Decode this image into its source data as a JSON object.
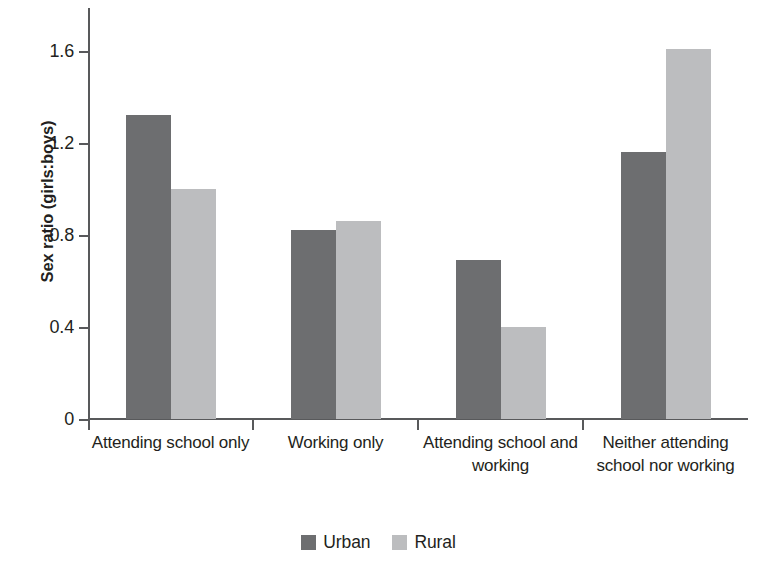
{
  "chart_data": {
    "type": "bar",
    "title": "",
    "xlabel": "",
    "ylabel": "Sex ratio (girls:boys)",
    "categories": [
      "Attending school only",
      "Working only",
      "Attending school and working",
      "Neither attending school nor working"
    ],
    "series": [
      {
        "name": "Urban",
        "color": "#6d6e70",
        "values": [
          1.32,
          0.82,
          0.69,
          1.16
        ]
      },
      {
        "name": "Rural",
        "color": "#bcbdbf",
        "values": [
          1.0,
          0.86,
          0.4,
          1.61
        ]
      }
    ],
    "ylim": [
      0,
      1.8
    ],
    "yticks": [
      0,
      0.4,
      0.8,
      1.2,
      1.6
    ],
    "ytick_labels": [
      "0",
      "0.4",
      "0.8",
      "1.2",
      "1.6"
    ],
    "grid": false,
    "legend_position": "bottom-center"
  },
  "legend": {
    "items": [
      {
        "label": "Urban",
        "color": "#6d6e70"
      },
      {
        "label": "Rural",
        "color": "#bcbdbf"
      }
    ]
  }
}
